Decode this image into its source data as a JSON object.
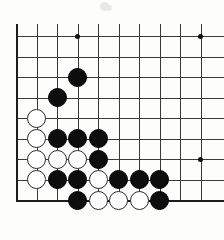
{
  "figure": {
    "kind": "go-board-diagram",
    "board_colors": {
      "background": "#fdfdfc",
      "grid_line": "#3a3a3a",
      "edge_line": "#1d1d1d",
      "black_stone": "#0d0d0d",
      "white_stone": "#ffffff",
      "white_stone_border": "#2a2a2a",
      "star_point": "#111111"
    }
  },
  "board": {
    "columns": 10,
    "rows": 9,
    "origin_x": 16,
    "origin_y": 36,
    "spacing": 20.5,
    "stone_diameter": 19,
    "visible_edges": [
      "left",
      "bottom"
    ],
    "column_labels": [
      "1",
      "2",
      "3",
      "4",
      "5",
      "6",
      "7",
      "8",
      "9",
      "10"
    ],
    "row_labels": [
      "1",
      "2",
      "3",
      "4",
      "5",
      "6",
      "7",
      "8",
      "9"
    ]
  },
  "star_points": [
    {
      "col": 3,
      "row": 0
    },
    {
      "col": 9,
      "row": 0
    },
    {
      "col": 9,
      "row": 6
    }
  ],
  "stones": [
    {
      "color": "black",
      "col": 3,
      "row": 2
    },
    {
      "color": "black",
      "col": 2,
      "row": 3
    },
    {
      "color": "white",
      "col": 1,
      "row": 4
    },
    {
      "color": "white",
      "col": 1,
      "row": 5
    },
    {
      "color": "black",
      "col": 2,
      "row": 5
    },
    {
      "color": "black",
      "col": 3,
      "row": 5
    },
    {
      "color": "black",
      "col": 4,
      "row": 5
    },
    {
      "color": "white",
      "col": 1,
      "row": 6
    },
    {
      "color": "white",
      "col": 2,
      "row": 6
    },
    {
      "color": "white",
      "col": 3,
      "row": 6
    },
    {
      "color": "black",
      "col": 4,
      "row": 6
    },
    {
      "color": "white",
      "col": 1,
      "row": 7
    },
    {
      "color": "black",
      "col": 2,
      "row": 7
    },
    {
      "color": "black",
      "col": 3,
      "row": 7
    },
    {
      "color": "white",
      "col": 4,
      "row": 7
    },
    {
      "color": "black",
      "col": 5,
      "row": 7
    },
    {
      "color": "black",
      "col": 6,
      "row": 7
    },
    {
      "color": "black",
      "col": 7,
      "row": 7
    },
    {
      "color": "black",
      "col": 3,
      "row": 8
    },
    {
      "color": "white",
      "col": 4,
      "row": 8
    },
    {
      "color": "white",
      "col": 5,
      "row": 8
    },
    {
      "color": "white",
      "col": 6,
      "row": 8
    },
    {
      "color": "black",
      "col": 7,
      "row": 8
    }
  ],
  "page_artifacts": [
    {
      "x": 100,
      "y": 2,
      "size": 9
    },
    {
      "x": 106,
      "y": 5,
      "size": 6
    }
  ]
}
